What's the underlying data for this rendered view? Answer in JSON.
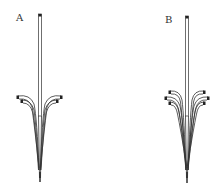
{
  "figure": {
    "panels": [
      {
        "label": "A",
        "description": "Vertical stem with two pairs of curved branches splaying out symmetrically, tapering to a point at bottom",
        "branch_pairs": 2
      },
      {
        "label": "B",
        "description": "Vertical stem with three pairs of curved branches splaying out symmetrically, tapering to a point at bottom",
        "branch_pairs": 3
      }
    ],
    "colors": {
      "background": "#ffffff",
      "stroke": "#333333",
      "cap": "#222222"
    }
  }
}
